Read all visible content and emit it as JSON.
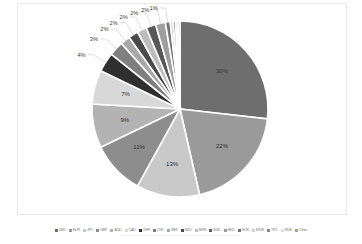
{
  "chart_data": {
    "type": "pie",
    "title": "",
    "subtitle": "",
    "xlabel": "",
    "ylabel": "",
    "grid": false,
    "legend_position": "bottom",
    "labels_show_percent": true,
    "categories": [
      "USD",
      "EUR",
      "JPY",
      "GBP",
      "AUD",
      "CAD",
      "CHF",
      "CNY",
      "SEK",
      "NZD",
      "MXN",
      "SGD",
      "HKD",
      "NOK",
      "KRW",
      "TRY",
      "RUB",
      "Other"
    ],
    "values": [
      30,
      22,
      13,
      11,
      9,
      7,
      4,
      3,
      2,
      2,
      2,
      2,
      2,
      1,
      0.6,
      0.5,
      0.5,
      0.4
    ],
    "data_labels": [
      "30%",
      "22%",
      "13%",
      "11%",
      "9%",
      "7%",
      "4%",
      "3%",
      "2%",
      "2%",
      "2%",
      "2%",
      "2%",
      "1%",
      "",
      "",
      "",
      ""
    ],
    "colors": [
      "#6e6e6e",
      "#9a9a9a",
      "#c9c9c9",
      "#8d8d8d",
      "#b3b3b3",
      "#d8d8d8",
      "#2f2f2f",
      "#7f7f7f",
      "#a8a8a8",
      "#4a4a4a",
      "#bdbdbd",
      "#585858",
      "#9e9e9e",
      "#747474",
      "#cfcfcf",
      "#868686",
      "#e0e0e0",
      "#a0a0a0"
    ]
  },
  "legend": {
    "items": [
      {
        "label": "USD"
      },
      {
        "label": "EUR"
      },
      {
        "label": "JPY"
      },
      {
        "label": "GBP"
      },
      {
        "label": "AUD"
      },
      {
        "label": "CAD"
      },
      {
        "label": "CHF"
      },
      {
        "label": "CNY"
      },
      {
        "label": "SEK"
      },
      {
        "label": "NZD"
      },
      {
        "label": "MXN"
      },
      {
        "label": "SGD"
      },
      {
        "label": "HKD"
      },
      {
        "label": "NOK"
      },
      {
        "label": "KRW"
      },
      {
        "label": "TRY"
      },
      {
        "label": "RUB"
      },
      {
        "label": "Other"
      }
    ]
  }
}
